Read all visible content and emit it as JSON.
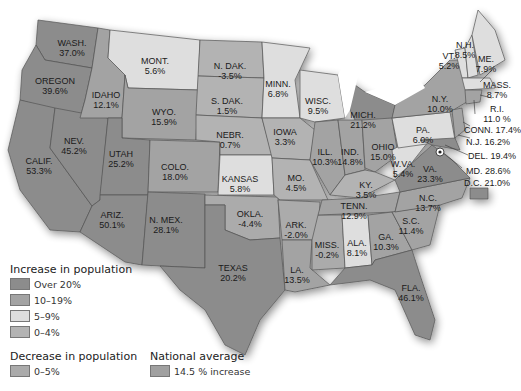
{
  "colors": {
    "over20": "#8c8c8c",
    "10to19": "#a3a3a3",
    "5to9": "#dedede",
    "0to4": "#b3b3b3",
    "decrease": "#ababab",
    "national": "#a0a0a0",
    "border": "#555555"
  },
  "states": [
    {
      "name": "WASH.",
      "value": "37.0%"
    },
    {
      "name": "OREGON",
      "value": "39.6%"
    },
    {
      "name": "IDAHO",
      "value": "12.1%"
    },
    {
      "name": "MONT.",
      "value": "5.6%"
    },
    {
      "name": "WYO.",
      "value": "15.9%"
    },
    {
      "name": "N. DAK.",
      "value": "-3.5%"
    },
    {
      "name": "S. DAK.",
      "value": "1.5%"
    },
    {
      "name": "NEBR.",
      "value": "0.7%"
    },
    {
      "name": "MINN.",
      "value": "6.8%"
    },
    {
      "name": "WISC.",
      "value": "9.5%"
    },
    {
      "name": "IOWA",
      "value": "3.3%"
    },
    {
      "name": "MICH.",
      "value": "21.2%"
    },
    {
      "name": "ILL.",
      "value": "10.3%"
    },
    {
      "name": "IND.",
      "value": "14.8%"
    },
    {
      "name": "OHIO",
      "value": "15.0%"
    },
    {
      "name": "N.Y.",
      "value": "10.0%"
    },
    {
      "name": "PA.",
      "value": "6.0%"
    },
    {
      "name": "VT.",
      "value": "5.2%"
    },
    {
      "name": "N.H.",
      "value": "8.5%"
    },
    {
      "name": "ME.",
      "value": "7.9%"
    },
    {
      "name": "MASS.",
      "value": "8.7%"
    },
    {
      "name": "R.I.",
      "value": "11.0 %"
    },
    {
      "name": "CONN.",
      "value": "17.4%"
    },
    {
      "name": "N.J.",
      "value": "16.2%"
    },
    {
      "name": "DEL.",
      "value": "19.4%"
    },
    {
      "name": "MD.",
      "value": "28.6%"
    },
    {
      "name": "D.C.",
      "value": "21.0%"
    },
    {
      "name": "W.VA.",
      "value": "5.4%"
    },
    {
      "name": "VA.",
      "value": "23.3%"
    },
    {
      "name": "N.C.",
      "value": "13.7%"
    },
    {
      "name": "S.C.",
      "value": "11.4%"
    },
    {
      "name": "GA.",
      "value": "10.3%"
    },
    {
      "name": "FLA.",
      "value": "46.1%"
    },
    {
      "name": "ALA.",
      "value": "8.1%"
    },
    {
      "name": "MISS.",
      "value": "-0.2%"
    },
    {
      "name": "TENN.",
      "value": "12.9%"
    },
    {
      "name": "KY.",
      "value": "3.5%"
    },
    {
      "name": "LA.",
      "value": "13.5%"
    },
    {
      "name": "ARK.",
      "value": "-2.0%"
    },
    {
      "name": "MO.",
      "value": "4.5%"
    },
    {
      "name": "KANSAS",
      "value": "5.8%"
    },
    {
      "name": "OKLA.",
      "value": "-4.4%"
    },
    {
      "name": "TEXAS",
      "value": "20.2%"
    },
    {
      "name": "N. MEX.",
      "value": "28.1%"
    },
    {
      "name": "COLO.",
      "value": "18.0%"
    },
    {
      "name": "UTAH",
      "value": "25.2%"
    },
    {
      "name": "ARIZ.",
      "value": "50.1%"
    },
    {
      "name": "NEV.",
      "value": "45.2%"
    },
    {
      "name": "CALIF.",
      "value": "53.3%"
    }
  ],
  "legend": {
    "increase_title": "Increase in population",
    "increase_items": [
      {
        "label": "Over 20%"
      },
      {
        "label": "10–19%"
      },
      {
        "label": "5–9%"
      },
      {
        "label": "0–4%"
      }
    ],
    "decrease_title": "Decrease in population",
    "decrease_items": [
      {
        "label": "0–5%"
      }
    ],
    "national_title": "National average",
    "national_items": [
      {
        "label": "14.5 % increase"
      }
    ]
  }
}
